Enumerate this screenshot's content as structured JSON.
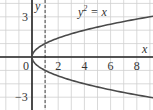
{
  "chart_data": {
    "type": "line",
    "title": "",
    "annotation": "y² = x",
    "annotation_base": "y",
    "annotation_sup": "2",
    "annotation_rest": " = x",
    "xlabel": "x",
    "ylabel": "y",
    "xlim": [
      -1,
      9.2
    ],
    "ylim": [
      -4,
      4
    ],
    "grid": true,
    "x_ticks": [
      0,
      2,
      4,
      6,
      8
    ],
    "x_tick_labels": [
      "0",
      "2",
      "4",
      "6",
      "8"
    ],
    "y_ticks": [
      3,
      -3
    ],
    "y_tick_labels": [
      "3",
      "−3"
    ],
    "asymptote_dashed_x": 1,
    "series": [
      {
        "name": "y^2 = x (upper branch)",
        "x": [
          0,
          0.25,
          1,
          2,
          3,
          4,
          5,
          6,
          7,
          8,
          9
        ],
        "y": [
          0,
          0.5,
          1,
          1.414,
          1.732,
          2,
          2.236,
          2.449,
          2.646,
          2.828,
          3
        ]
      },
      {
        "name": "y^2 = x (lower branch)",
        "x": [
          0,
          0.25,
          1,
          2,
          3,
          4,
          5,
          6,
          7,
          8,
          9
        ],
        "y": [
          0,
          -0.5,
          -1,
          -1.414,
          -1.732,
          -2,
          -2.236,
          -2.449,
          -2.646,
          -2.828,
          -3
        ]
      }
    ],
    "colors": {
      "curve": "#4a4a4a",
      "axis": "#222222",
      "grid": "#cfcfcf",
      "dashed": "#444444"
    }
  }
}
